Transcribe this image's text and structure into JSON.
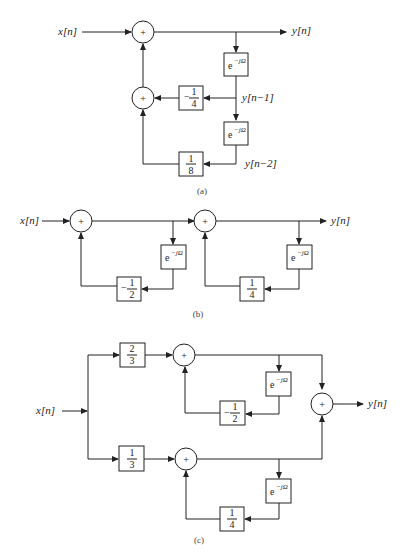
{
  "diagrams": {
    "a": {
      "caption": "(a)",
      "input": "x[n]",
      "output": "y[n]",
      "delay1": "e",
      "delay1_exp": "−jΩ",
      "delay2": "e",
      "delay2_exp": "−jΩ",
      "tap1_label": "y[n−1]",
      "tap2_label": "y[n−2]",
      "gain1": {
        "sign": "−",
        "num": "1",
        "den": "4"
      },
      "gain2": {
        "sign": "",
        "num": "1",
        "den": "8"
      },
      "adder": "+"
    },
    "b": {
      "caption": "(b)",
      "input": "x[n]",
      "output": "y[n]",
      "delay": "e",
      "delay_exp": "−jΩ",
      "gain1": {
        "sign": "−",
        "num": "1",
        "den": "2"
      },
      "gain2": {
        "sign": "",
        "num": "1",
        "den": "4"
      },
      "adder": "+"
    },
    "c": {
      "caption": "(c)",
      "input": "x[n]",
      "output": "y[n]",
      "delay": "e",
      "delay_exp": "−jΩ",
      "in_gain1": {
        "num": "2",
        "den": "3"
      },
      "in_gain2": {
        "num": "1",
        "den": "3"
      },
      "fb_gain1": {
        "sign": "−",
        "num": "1",
        "den": "2"
      },
      "fb_gain2": {
        "sign": "",
        "num": "1",
        "den": "4"
      },
      "adder": "+"
    }
  }
}
